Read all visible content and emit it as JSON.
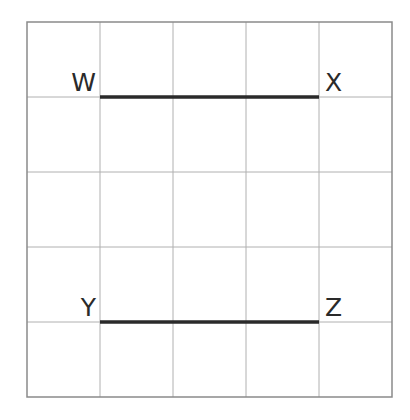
{
  "diagram": {
    "type": "grid-with-segments",
    "grid": {
      "columns": 5,
      "rows": 5,
      "left": 27,
      "top": 22,
      "cell_width": 73,
      "cell_height": 75,
      "line_color": "#b0b0b0",
      "border_color": "#8a8a8a"
    },
    "segments": [
      {
        "from": "W",
        "to": "X",
        "row_line": 1,
        "col_start": 1,
        "col_end": 4,
        "color": "#2a2a2a"
      },
      {
        "from": "Y",
        "to": "Z",
        "row_line": 4,
        "col_start": 1,
        "col_end": 4,
        "color": "#2a2a2a"
      }
    ],
    "points": [
      {
        "name": "W",
        "label": "W"
      },
      {
        "name": "X",
        "label": "X"
      },
      {
        "name": "Y",
        "label": "Y"
      },
      {
        "name": "Z",
        "label": "Z"
      }
    ]
  }
}
